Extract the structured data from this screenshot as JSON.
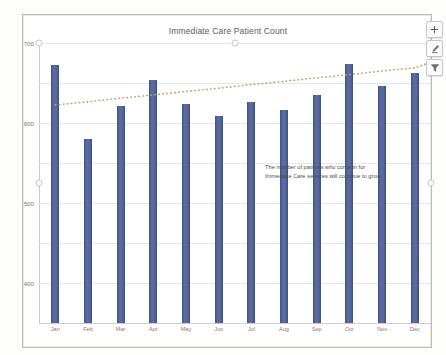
{
  "chart_title": "Immediate Care Patient Count",
  "annotation": "The number of patients who come in for Immediate Care services will continue to grow.",
  "buttons": {
    "add_element": "chart-elements-plus-icon",
    "styles": "chart-styles-brush-icon",
    "filters": "chart-filters-funnel-icon"
  },
  "colors": {
    "bar": "#4a5b8c",
    "trendline": "#b5ab68",
    "gridline": "#e3e6ec",
    "frame": "#b9bdb4",
    "axis_text": "#7b7b7b",
    "title_text": "#5a5a5a"
  },
  "chart_data": {
    "type": "bar",
    "title": "Immediate Care Patient Count",
    "xlabel": "",
    "ylabel": "",
    "ylim": [
      0,
      700
    ],
    "yticks": [
      0,
      100,
      200,
      300,
      400,
      500,
      600,
      700
    ],
    "ytick_labels": [
      "0",
      "100",
      "200",
      "300",
      "400",
      "500",
      "600",
      "700"
    ],
    "grid": true,
    "legend": "none",
    "categories": [
      "Jan",
      "Feb",
      "Mar",
      "Apr",
      "May",
      "Jun",
      "Jul",
      "Aug",
      "Sep",
      "Oct",
      "Nov",
      "Dec"
    ],
    "series": [
      {
        "name": "Patient Count",
        "type": "bar",
        "color": "#4a5b8c",
        "values": [
          645,
          460,
          543,
          607,
          548,
          518,
          553,
          533,
          570,
          647,
          592,
          625
        ]
      },
      {
        "name": "Linear Trendline",
        "type": "line",
        "style": "dotted",
        "color": "#b5ab68",
        "values": [
          545,
          553,
          562,
          570,
          579,
          587,
          596,
          604,
          613,
          621,
          630,
          638
        ],
        "extends_beyond_last_category": true,
        "extended_end_value": 652
      }
    ],
    "annotations": [
      {
        "text": "The number of patients who come in for Immediate Care services will continue to grow.",
        "x_category": "Nov",
        "y_value": 320
      }
    ]
  }
}
